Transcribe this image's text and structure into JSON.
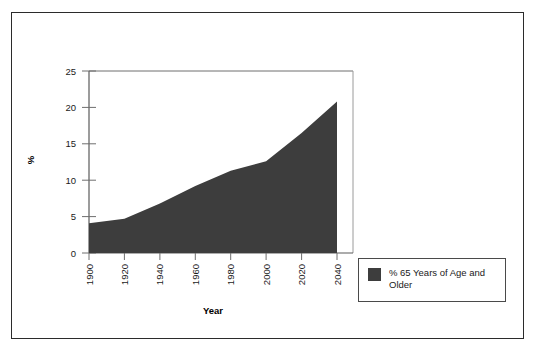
{
  "chart_data": {
    "type": "area",
    "title": "",
    "xlabel": "Year",
    "ylabel": "%",
    "x": [
      1900,
      1920,
      1940,
      1960,
      1980,
      2000,
      2020,
      2040
    ],
    "categories": [
      "1900",
      "1920",
      "1940",
      "1960",
      "1980",
      "2000",
      "2020",
      "2040"
    ],
    "series": [
      {
        "name": "% 65 Years of Age and Older",
        "values": [
          4.1,
          4.7,
          6.8,
          9.2,
          11.3,
          12.6,
          16.5,
          20.8
        ],
        "color": "#3d3d3d"
      }
    ],
    "xlim": [
      1900,
      2040
    ],
    "ylim": [
      0,
      25
    ],
    "yticks": [
      "0",
      "5",
      "10",
      "15",
      "20",
      "25"
    ],
    "ytick_values": [
      0,
      5,
      10,
      15,
      20,
      25
    ],
    "xticks": [
      "1900",
      "1920",
      "1940",
      "1960",
      "1980",
      "2000",
      "2020",
      "2040"
    ],
    "grid": false,
    "legend_position": "right-bottom-outside",
    "xtick_rotation": 90
  },
  "legend": {
    "entries": [
      {
        "label_line1": "% 65 Years of Age",
        "label_line2": "and Older",
        "color": "#3d3d3d"
      }
    ]
  },
  "axes": {
    "x_title": "Year",
    "y_title": "%"
  },
  "colors": {
    "area_fill": "#3d3d3d",
    "frame": "#2b2b2b",
    "axis": "#4a4a4a",
    "text": "#1a1a1a"
  }
}
